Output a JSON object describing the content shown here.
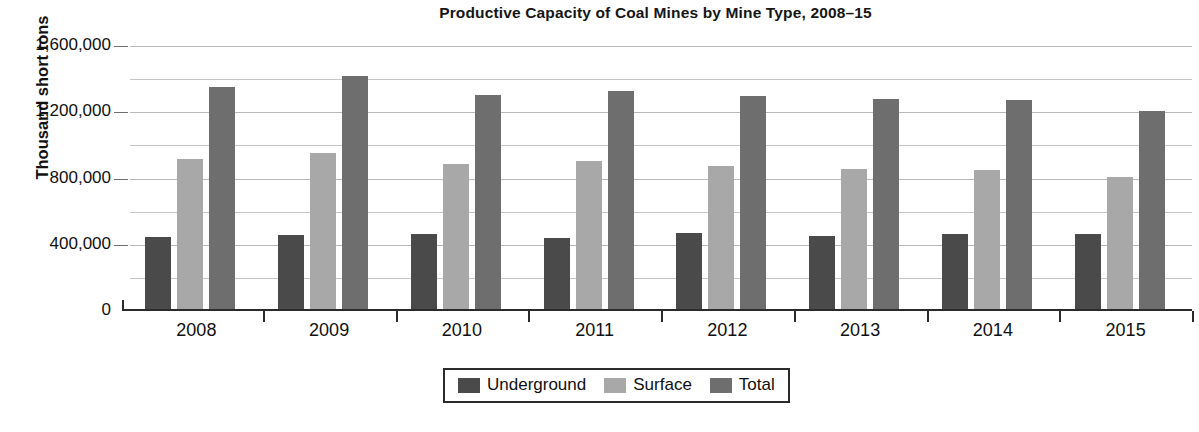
{
  "chart_data": {
    "type": "bar",
    "title": "Productive Capacity of Coal Mines by Mine Type, 2008–15",
    "xlabel": "",
    "ylabel": "Thousand short tons",
    "categories": [
      "2008",
      "2009",
      "2010",
      "2011",
      "2012",
      "2013",
      "2014",
      "2015"
    ],
    "series": [
      {
        "name": "Underground",
        "color": "#4a4a4a",
        "values": [
          448000,
          456000,
          465000,
          443000,
          470000,
          450000,
          468000,
          462000
        ]
      },
      {
        "name": "Surface",
        "color": "#a8a8a8",
        "values": [
          920000,
          955000,
          890000,
          905000,
          875000,
          860000,
          850000,
          810000
        ]
      },
      {
        "name": "Total",
        "color": "#6e6e6e",
        "values": [
          1350000,
          1420000,
          1305000,
          1330000,
          1298000,
          1283000,
          1272000,
          1205000
        ]
      }
    ],
    "ylim": [
      0,
      1600000
    ],
    "ytick_values": [
      0,
      400000,
      800000,
      1200000,
      1600000
    ],
    "ytick_labels": [
      "0",
      "400,000",
      "800,000",
      "1,200,000",
      "1,600,000"
    ],
    "minor_tick_values": [
      200000,
      600000,
      1000000,
      1400000
    ],
    "grid": true,
    "legend_position": "bottom-center",
    "legend_entries": [
      "Underground",
      "Surface",
      "Total"
    ]
  },
  "legend": {
    "items": [
      {
        "label": "Underground",
        "swatch": "legend-swatch-underground"
      },
      {
        "label": "Surface",
        "swatch": "legend-swatch-surface"
      },
      {
        "label": "Total",
        "swatch": "legend-swatch-total"
      }
    ]
  }
}
